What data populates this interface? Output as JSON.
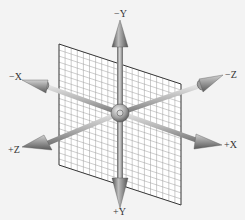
{
  "diagram": {
    "colors": {
      "background": "#f3f3f3",
      "plane_fill": "#ffffff",
      "plane_grid": "#9a9a9a",
      "plane_edge": "#333333",
      "axis_light": "#d8d8d8",
      "axis_dark": "#6a6a6a",
      "cone_light": "#bdbdbd",
      "cone_dark": "#555555",
      "label": "#333333"
    },
    "axes": [
      {
        "id": "neg-y",
        "label": "−Y"
      },
      {
        "id": "pos-y",
        "label": "+Y"
      },
      {
        "id": "neg-x",
        "label": "−X"
      },
      {
        "id": "pos-x",
        "label": "+X"
      },
      {
        "id": "neg-z",
        "label": "−Z"
      },
      {
        "id": "pos-z",
        "label": "+Z"
      }
    ]
  }
}
